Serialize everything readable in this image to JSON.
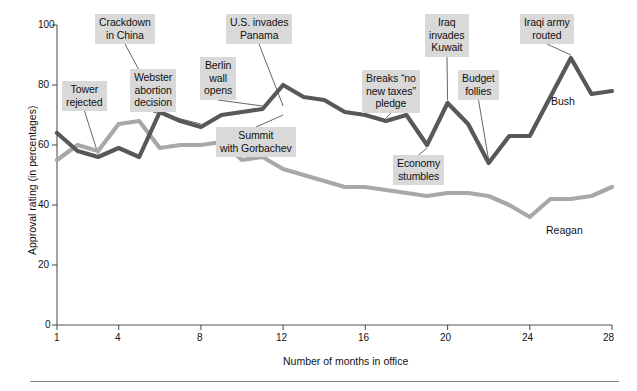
{
  "chart_data": {
    "type": "line",
    "title": "",
    "subtitle": "",
    "xlabel": "Number of months in office",
    "ylabel": "Approval rating (in percentages)",
    "xlim": [
      1,
      28
    ],
    "ylim": [
      0,
      100
    ],
    "xticks": [
      1,
      4,
      8,
      12,
      16,
      20,
      24,
      28
    ],
    "xtick_labels": [
      "1",
      "4",
      "8",
      "12",
      "16",
      "20",
      "24",
      "28"
    ],
    "yticks": [
      0,
      20,
      40,
      60,
      80,
      100
    ],
    "ytick_labels": [
      "0",
      "20",
      "40",
      "60",
      "80",
      "100"
    ],
    "grid": false,
    "legend_position": "inline-end-labels",
    "x": [
      1,
      2,
      3,
      4,
      5,
      6,
      7,
      8,
      9,
      10,
      11,
      12,
      13,
      14,
      15,
      16,
      17,
      18,
      19,
      20,
      21,
      22,
      23,
      24,
      25,
      26,
      27,
      28
    ],
    "series": [
      {
        "name": "Bush",
        "color": "#585858",
        "values": [
          64,
          58,
          56,
          59,
          56,
          71,
          68,
          66,
          70,
          71,
          72,
          80,
          76,
          75,
          71,
          70,
          68,
          70,
          60,
          74,
          67,
          54,
          63,
          63,
          76,
          89,
          77,
          78
        ]
      },
      {
        "name": "Reagan",
        "color": "#a8a8a8",
        "values": [
          55,
          60,
          58,
          67,
          68,
          59,
          60,
          60,
          61,
          55,
          56,
          52,
          50,
          48,
          46,
          46,
          45,
          44,
          43,
          44,
          44,
          43,
          40,
          36,
          42,
          42,
          43,
          46
        ]
      }
    ],
    "annotations": [
      {
        "id": "tower-rejected",
        "label": "Tower\nrejected",
        "month": 3,
        "value": 56
      },
      {
        "id": "crackdown-in-china",
        "label": "Crackdown\nin China",
        "month": 6,
        "value": 71
      },
      {
        "id": "webster-abortion-decision",
        "label": "Webster\nabortion\ndecision",
        "month": 8,
        "value": 66
      },
      {
        "id": "berlin-wall-opens",
        "label": "Berlin\nwall\nopens",
        "month": 11,
        "value": 72
      },
      {
        "id": "summit-with-gorbachev",
        "label": "Summit\nwith Gorbachev",
        "month": 12,
        "value": 71
      },
      {
        "id": "us-invades-panama",
        "label": "U.S. invades\nPanama",
        "month": 12,
        "value": 72
      },
      {
        "id": "breaks-no-new-taxes-pledge",
        "label": "Breaks “no\nnew taxes”\npledge",
        "month": 17,
        "value": 68
      },
      {
        "id": "economy-stumbles",
        "label": "Economy\nstumbles",
        "month": 19,
        "value": 60
      },
      {
        "id": "iraq-invades-kuwait",
        "label": "Iraq\ninvades\nKuwait",
        "month": 20,
        "value": 74
      },
      {
        "id": "budget-follies",
        "label": "Budget\nfollies",
        "month": 22,
        "value": 54
      },
      {
        "id": "iraqi-army-routed",
        "label": "Iraqi army\nrouted",
        "month": 26,
        "value": 89
      }
    ]
  },
  "axes": {
    "x_title": "Number of months in office",
    "y_title": "Approval rating (in percentages)",
    "x_tick_1": "1",
    "x_tick_4": "4",
    "x_tick_8": "8",
    "x_tick_12": "12",
    "x_tick_16": "16",
    "x_tick_20": "20",
    "x_tick_24": "24",
    "x_tick_28": "28",
    "y_tick_0": "0",
    "y_tick_20": "20",
    "y_tick_40": "40",
    "y_tick_60": "60",
    "y_tick_80": "80",
    "y_tick_100": "100"
  },
  "series_labels": {
    "bush": "Bush",
    "reagan": "Reagan"
  },
  "annotation_labels": {
    "tower_rejected": "Tower\nrejected",
    "crackdown_in_china": "Crackdown\nin China",
    "webster_abortion_decision": "Webster\nabortion\ndecision",
    "berlin_wall_opens": "Berlin\nwall\nopens",
    "summit_with_gorbachev": "Summit\nwith Gorbachev",
    "us_invades_panama": "U.S. invades\nPanama",
    "breaks_no_new_taxes_pledge": "Breaks “no\nnew taxes”\npledge",
    "economy_stumbles": "Economy\nstumbles",
    "iraq_invades_kuwait": "Iraq\ninvades\nKuwait",
    "budget_follies": "Budget\nfollies",
    "iraqi_army_routed": "Iraqi army\nrouted"
  },
  "colors": {
    "bush_line": "#585858",
    "reagan_line": "#a8a8a8",
    "annotation_box": "#d9d9d9",
    "axis": "#555555",
    "text": "#111111"
  }
}
